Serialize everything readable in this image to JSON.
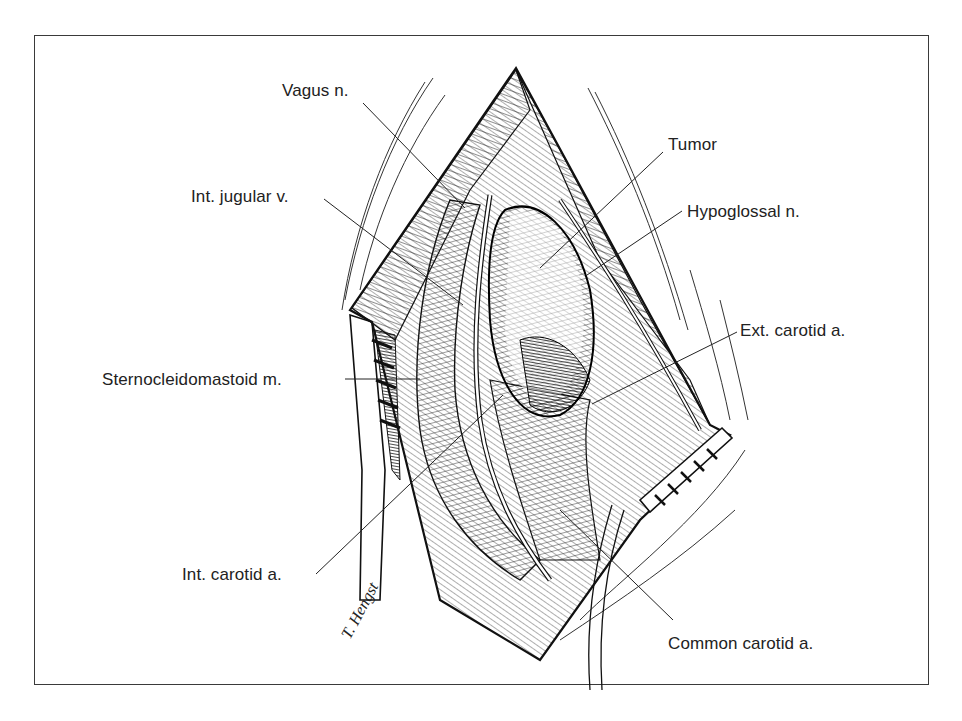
{
  "figure": {
    "type": "surgical-illustration",
    "frame_color": "#3a3a3a",
    "ink_color": "#111111",
    "signature": "T. Hengst"
  },
  "labels": {
    "vagus": "Vagus n.",
    "int_jugular": "Int. jugular v.",
    "scm": "Sternocleidomastoid m.",
    "int_carotid": "Int. carotid a.",
    "tumor": "Tumor",
    "hypoglossal": "Hypoglossal n.",
    "ext_carotid": "Ext. carotid a.",
    "common_carotid": "Common carotid a."
  }
}
